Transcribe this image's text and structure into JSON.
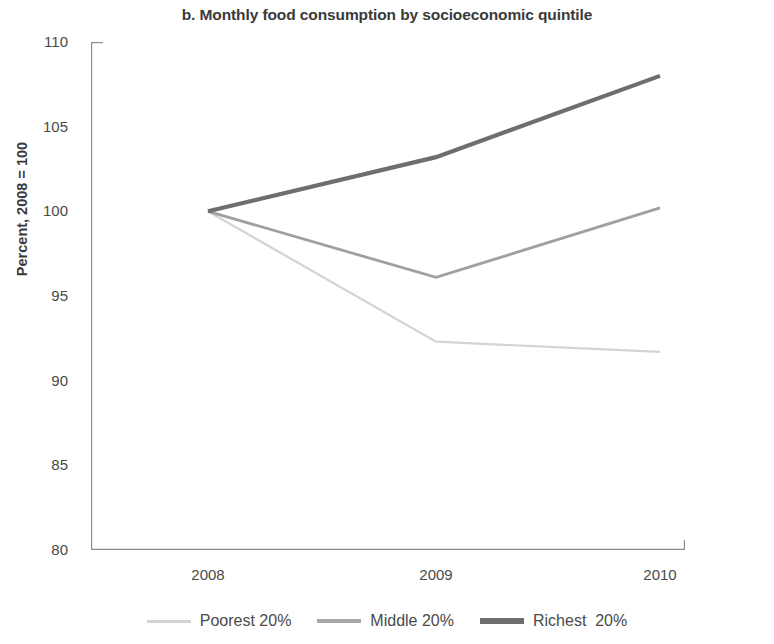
{
  "chart_data": {
    "type": "line",
    "title": "b. Monthly food consumption by socioeconomic quintile",
    "xlabel": "",
    "ylabel": "Percent, 2008 = 100",
    "x": [
      "2008",
      "2009",
      "2010"
    ],
    "categories": [
      "2008",
      "2009",
      "2010"
    ],
    "xtick_labels": [
      "2008",
      "2009",
      "2010"
    ],
    "ytick_labels": [
      "110",
      "105",
      "100",
      "95",
      "90",
      "85",
      "80"
    ],
    "ytick_values": [
      110,
      105,
      100,
      95,
      90,
      85,
      80
    ],
    "ylim": [
      80,
      110
    ],
    "grid": false,
    "legend_position": "bottom",
    "series": [
      {
        "name": "Poorest 20%",
        "values": [
          100,
          92.3,
          91.7
        ],
        "color": "#d3d3d3",
        "width": 2.2
      },
      {
        "name": "Middle 20%",
        "values": [
          100,
          96.1,
          100.2
        ],
        "color": "#a0a0a0",
        "width": 2.8
      },
      {
        "name": "Richest  20%",
        "values": [
          100,
          103.2,
          108
        ],
        "color": "#6e6e6e",
        "width": 4.2
      }
    ]
  },
  "axis": {
    "line_color": "#8c8c8c",
    "tick_color": "#8c8c8c"
  },
  "legend": {
    "items": [
      {
        "label": "Poorest 20%",
        "color": "#d3d3d3",
        "thickness": "3px"
      },
      {
        "label": "Middle 20%",
        "color": "#a8a8a8",
        "thickness": "4px"
      },
      {
        "label": "Richest  20%",
        "color": "#6e6e6e",
        "thickness": "6px"
      }
    ]
  }
}
